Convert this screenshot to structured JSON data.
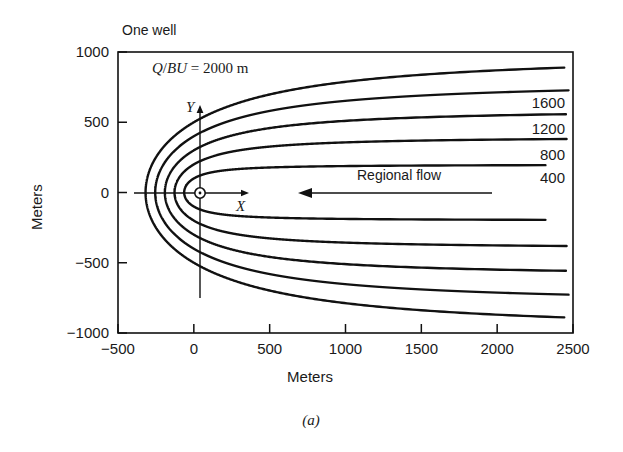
{
  "figure": {
    "caption": "(a)",
    "panel_note": "One well",
    "source_note": "Q/BU = 2000 m",
    "regional_flow_label": "Regional flow",
    "x_axis_symbol": "X",
    "y_axis_symbol": "Y",
    "well_marker": "well-symbol"
  },
  "chart_data": {
    "type": "line",
    "title": "One well",
    "xlabel": "Meters",
    "ylabel": "Meters",
    "xlim": [
      -500,
      2500
    ],
    "ylim": [
      -1000,
      1000
    ],
    "xticks": [
      "-500",
      "0",
      "500",
      "1000",
      "1500",
      "2000",
      "2500"
    ],
    "xtick_values": [
      -500,
      0,
      500,
      1000,
      1500,
      2000,
      2500
    ],
    "yticks": [
      "1000",
      "500",
      "0",
      "-500",
      "-1000"
    ],
    "ytick_values": [
      1000,
      500,
      0,
      -500,
      -1000
    ],
    "grid": false,
    "legend": "inline-curve-labels",
    "annotations": [
      {
        "name": "one-well",
        "text": "One well",
        "x": -380,
        "y": 1090
      },
      {
        "name": "q-over-bu",
        "text": "Q/BU = 2000 m",
        "x": -230,
        "y": 800
      },
      {
        "name": "regional-flow",
        "text": "Regional flow",
        "x": 1000,
        "y": 120
      },
      {
        "name": "x-axis-arrow-label",
        "text": "X",
        "x": 420,
        "y": -95
      },
      {
        "name": "y-axis-arrow-label",
        "text": "Y",
        "x": -90,
        "y": 540
      },
      {
        "name": "well-location",
        "text": "",
        "x": 0,
        "y": 0
      }
    ],
    "curve_labels": [
      "1600",
      "1200",
      "800",
      "400"
    ],
    "curve_label_values": [
      1600,
      1200,
      800,
      400
    ],
    "series": [
      {
        "name": "2000",
        "qbu": 2000,
        "stagnation_x": -318,
        "asymptote_half_width": 1000,
        "upper_end_y": 905,
        "lower_end_y": -905
      },
      {
        "name": "1600",
        "qbu": 1600,
        "stagnation_x": -255,
        "asymptote_half_width": 800,
        "upper_end_y": 725,
        "lower_end_y": -740
      },
      {
        "name": "1200",
        "qbu": 1200,
        "stagnation_x": -191,
        "asymptote_half_width": 600,
        "upper_end_y": 540,
        "lower_end_y": -560
      },
      {
        "name": "800",
        "qbu": 800,
        "stagnation_x": -127,
        "asymptote_half_width": 400,
        "upper_end_y": 355,
        "lower_end_y": -375
      },
      {
        "name": "400",
        "qbu": 400,
        "stagnation_x": -64,
        "asymptote_half_width": 200,
        "upper_end_y": 190,
        "lower_end_y": -205
      }
    ],
    "regional_flow_arrow": {
      "direction": "left",
      "from_x": 1960,
      "to_x": 610,
      "y": 0
    }
  }
}
